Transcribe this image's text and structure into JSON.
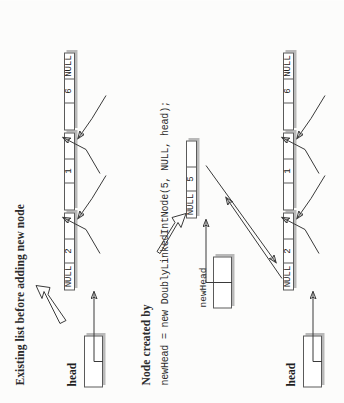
{
  "figure": {
    "type": "doubly-linked-list-insertion-diagram",
    "title_top": "Existing list before adding new node",
    "title_middle": "Node created by",
    "code_line": "newHead = new DoublyLinkedIntNode(5, NULL, head);"
  },
  "labels": {
    "head_top": "head",
    "head_bottom": "head",
    "newhead": "newHead"
  },
  "top_list": {
    "nodes": [
      {
        "prev": "NULL",
        "data": "2",
        "next": ""
      },
      {
        "prev": "",
        "data": "1",
        "next": ""
      },
      {
        "prev": "",
        "data": "6",
        "next": "NULL"
      }
    ]
  },
  "new_node": {
    "prev": "NULL",
    "data": "5",
    "next": ""
  },
  "bottom_list": {
    "nodes": [
      {
        "prev": "NULL",
        "data": "2",
        "next": ""
      },
      {
        "prev": "",
        "data": "1",
        "next": ""
      },
      {
        "prev": "",
        "data": "6",
        "next": "NULL"
      }
    ]
  },
  "colors": {
    "ink": "#2b2b2b",
    "box_border": "#5a5a5a",
    "box_shadow": "#b9b9b9",
    "paper": "#fdfdfc",
    "arrow": "#3a3a3a"
  }
}
